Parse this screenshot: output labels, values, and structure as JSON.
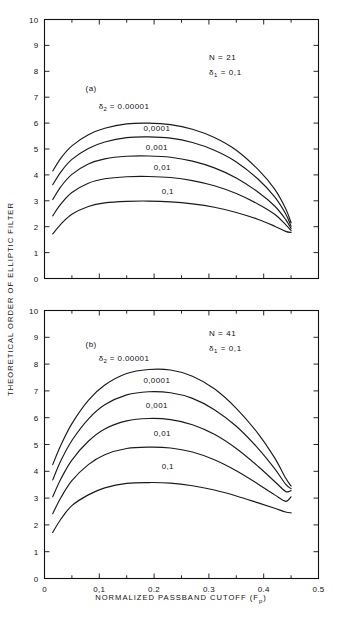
{
  "figure": {
    "ylabel": "THEORETICAL ORDER OF ELLIPTIC FILTER",
    "xlabel_main": "NORMALIZED PASSBAND CUTOFF (F",
    "xlabel_sub": "p",
    "xlabel_close": ")"
  },
  "chart_data": [
    {
      "type": "line",
      "panel": "(a)",
      "title": "",
      "xlabel": "NORMALIZED PASSBAND CUTOFF (Fp)",
      "ylabel": "THEORETICAL ORDER OF ELLIPTIC FILTER",
      "xlim": [
        0,
        0.5
      ],
      "ylim": [
        0,
        10
      ],
      "xticks": [
        0,
        0.1,
        0.2,
        0.3,
        0.4,
        0.5
      ],
      "xticklabels": [
        "0",
        "0,1",
        "0.2",
        "0.3",
        "0.4",
        "0.5"
      ],
      "yticks": [
        0,
        1,
        2,
        3,
        4,
        5,
        6,
        7,
        8,
        9,
        10
      ],
      "yticklabels": [
        "0",
        "1",
        "2",
        "3",
        "4",
        "5",
        "6",
        "7",
        "8",
        "9",
        "10"
      ],
      "grid": false,
      "annotations": [
        {
          "text": "N = 21",
          "x": 0.3,
          "y": 8.45
        },
        {
          "text": "δ₁ = 0,1",
          "x": 0.3,
          "y": 7.85
        },
        {
          "text": "(a)",
          "x": 0.085,
          "y": 7.25
        }
      ],
      "series": [
        {
          "name": "δ₂ = 0.00001",
          "label": "δ₂ = 0.00001",
          "label_x": 0.145,
          "label_y": 6.55,
          "x": [
            0.015,
            0.03,
            0.05,
            0.08,
            0.11,
            0.15,
            0.19,
            0.23,
            0.27,
            0.31,
            0.35,
            0.39,
            0.42,
            0.44,
            0.45
          ],
          "y": [
            4.15,
            4.65,
            5.12,
            5.55,
            5.8,
            5.97,
            6.0,
            5.94,
            5.76,
            5.44,
            4.95,
            4.2,
            3.45,
            2.7,
            2.15
          ]
        },
        {
          "name": "0,0001",
          "label": "0,0001",
          "label_x": 0.205,
          "label_y": 5.7,
          "x": [
            0.015,
            0.03,
            0.05,
            0.08,
            0.11,
            0.15,
            0.19,
            0.23,
            0.27,
            0.31,
            0.35,
            0.39,
            0.42,
            0.44,
            0.45
          ],
          "y": [
            3.62,
            4.12,
            4.6,
            5.02,
            5.27,
            5.44,
            5.47,
            5.42,
            5.25,
            4.95,
            4.5,
            3.83,
            3.15,
            2.5,
            2.02
          ]
        },
        {
          "name": "0,001",
          "label": "0,001",
          "label_x": 0.205,
          "label_y": 4.95,
          "x": [
            0.015,
            0.03,
            0.05,
            0.08,
            0.11,
            0.15,
            0.19,
            0.23,
            0.27,
            0.31,
            0.35,
            0.39,
            0.42,
            0.44,
            0.45
          ],
          "y": [
            3.05,
            3.55,
            4.02,
            4.42,
            4.62,
            4.72,
            4.73,
            4.68,
            4.53,
            4.27,
            3.88,
            3.33,
            2.8,
            2.28,
            1.92
          ]
        },
        {
          "name": "0,01",
          "label": "0,01",
          "label_x": 0.215,
          "label_y": 4.2,
          "x": [
            0.015,
            0.03,
            0.05,
            0.08,
            0.11,
            0.15,
            0.19,
            0.23,
            0.27,
            0.31,
            0.35,
            0.39,
            0.42,
            0.44,
            0.45
          ],
          "y": [
            2.42,
            2.88,
            3.32,
            3.68,
            3.85,
            3.93,
            3.94,
            3.9,
            3.78,
            3.58,
            3.28,
            2.87,
            2.48,
            2.08,
            1.85
          ]
        },
        {
          "name": "0,1",
          "label": "0,1",
          "label_x": 0.225,
          "label_y": 3.25,
          "x": [
            0.015,
            0.03,
            0.05,
            0.08,
            0.11,
            0.15,
            0.19,
            0.23,
            0.27,
            0.31,
            0.35,
            0.39,
            0.42,
            0.44,
            0.45
          ],
          "y": [
            1.72,
            2.1,
            2.48,
            2.78,
            2.92,
            2.98,
            2.99,
            2.96,
            2.88,
            2.75,
            2.55,
            2.28,
            2.02,
            1.82,
            1.78
          ]
        }
      ]
    },
    {
      "type": "line",
      "panel": "(b)",
      "title": "",
      "xlabel": "NORMALIZED PASSBAND CUTOFF (Fp)",
      "ylabel": "THEORETICAL ORDER OF ELLIPTIC FILTER",
      "xlim": [
        0,
        0.5
      ],
      "ylim": [
        0,
        10
      ],
      "xticks": [
        0,
        0.1,
        0.2,
        0.3,
        0.4,
        0.5
      ],
      "xticklabels": [
        "0",
        "0,1",
        "0.2",
        "0.3",
        "0.4",
        "0.5"
      ],
      "yticks": [
        0,
        1,
        2,
        3,
        4,
        5,
        6,
        7,
        8,
        9,
        10
      ],
      "yticklabels": [
        "0",
        "1",
        "2",
        "3",
        "4",
        "5",
        "6",
        "7",
        "8",
        "9",
        "10"
      ],
      "grid": false,
      "annotations": [
        {
          "text": "N = 41",
          "x": 0.3,
          "y": 9.05
        },
        {
          "text": "δ₁ = 0,1",
          "x": 0.3,
          "y": 8.5
        },
        {
          "text": "(b)",
          "x": 0.085,
          "y": 8.65
        }
      ],
      "series": [
        {
          "name": "δ₂ = 0.00001",
          "label": "δ₂ = 0.00001",
          "label_x": 0.145,
          "label_y": 8.1,
          "x": [
            0.015,
            0.03,
            0.05,
            0.08,
            0.11,
            0.15,
            0.19,
            0.23,
            0.27,
            0.31,
            0.35,
            0.39,
            0.42,
            0.44,
            0.45
          ],
          "y": [
            4.25,
            4.98,
            5.78,
            6.65,
            7.22,
            7.65,
            7.8,
            7.78,
            7.55,
            7.08,
            6.35,
            5.4,
            4.5,
            3.75,
            3.45
          ]
        },
        {
          "name": "0,0001",
          "label": "0,0001",
          "label_x": 0.205,
          "label_y": 7.3,
          "x": [
            0.015,
            0.03,
            0.05,
            0.08,
            0.11,
            0.15,
            0.19,
            0.23,
            0.27,
            0.31,
            0.35,
            0.39,
            0.42,
            0.44,
            0.45
          ],
          "y": [
            3.68,
            4.4,
            5.15,
            5.95,
            6.48,
            6.85,
            6.97,
            6.93,
            6.72,
            6.3,
            5.68,
            4.85,
            4.1,
            3.52,
            3.35
          ]
        },
        {
          "name": "0,001",
          "label": "0,001",
          "label_x": 0.205,
          "label_y": 6.35,
          "x": [
            0.015,
            0.03,
            0.05,
            0.08,
            0.11,
            0.15,
            0.19,
            0.23,
            0.27,
            0.31,
            0.35,
            0.39,
            0.42,
            0.44,
            0.45
          ],
          "y": [
            3.05,
            3.72,
            4.42,
            5.12,
            5.58,
            5.88,
            5.97,
            5.93,
            5.74,
            5.38,
            4.85,
            4.18,
            3.62,
            3.25,
            3.28
          ]
        },
        {
          "name": "0,01",
          "label": "0,01",
          "label_x": 0.215,
          "label_y": 5.3,
          "x": [
            0.015,
            0.03,
            0.05,
            0.08,
            0.11,
            0.15,
            0.19,
            0.23,
            0.27,
            0.31,
            0.35,
            0.39,
            0.42,
            0.44,
            0.45
          ],
          "y": [
            2.42,
            3.02,
            3.65,
            4.25,
            4.62,
            4.85,
            4.9,
            4.87,
            4.72,
            4.43,
            4.02,
            3.52,
            3.12,
            2.88,
            3.05
          ]
        },
        {
          "name": "0,1",
          "label": "0,1",
          "label_x": 0.225,
          "label_y": 4.1,
          "x": [
            0.015,
            0.03,
            0.05,
            0.08,
            0.11,
            0.15,
            0.19,
            0.23,
            0.27,
            0.31,
            0.35,
            0.39,
            0.42,
            0.44,
            0.45
          ],
          "y": [
            1.72,
            2.22,
            2.72,
            3.12,
            3.38,
            3.55,
            3.58,
            3.56,
            3.46,
            3.3,
            3.08,
            2.82,
            2.62,
            2.48,
            2.45
          ]
        }
      ]
    }
  ]
}
